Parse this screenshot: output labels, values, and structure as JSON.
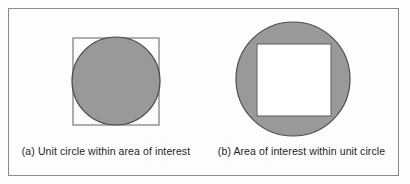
{
  "figure": {
    "background_color": "#fdfdfd",
    "frame_color": "#8b8b8b",
    "shape_fill_color": "#999999",
    "shape_stroke_color": "#4d4d4d",
    "square_fill_color": "#ffffff",
    "caption_color": "#1d1d1d",
    "panels": [
      {
        "id": "panel-a",
        "caption": "(a) Unit circle within area of interest",
        "description": "A square area of interest containing an inscribed shaded circle",
        "shapes": {
          "square": {
            "x": 65,
            "y": 30,
            "width": 86,
            "height": 87,
            "fill": "none",
            "stroke": "#7a7a7a"
          },
          "circle": {
            "cx": 108,
            "cy": 73,
            "r": 44,
            "fill": "#999999",
            "stroke": "#4d4d4d"
          }
        }
      },
      {
        "id": "panel-b",
        "caption": "(b) Area of interest within unit circle",
        "description": "A shaded circle containing an inscribed white square area of interest",
        "shapes": {
          "circle": {
            "cx": 89,
            "cy": 71,
            "r": 57,
            "fill": "#999999",
            "stroke": "#4d4d4d"
          },
          "square": {
            "x": 53,
            "y": 36,
            "width": 74,
            "height": 72,
            "fill": "#ffffff",
            "stroke": "#6f6f6f"
          }
        }
      }
    ]
  }
}
